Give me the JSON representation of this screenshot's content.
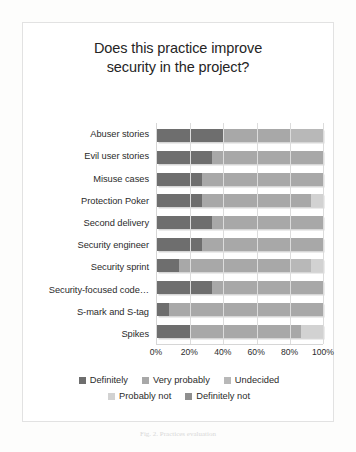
{
  "chart_data": {
    "type": "bar",
    "title": "Does this practice improve security in the project?",
    "title_line1": "Does this practice improve",
    "title_line2": "security in the project?",
    "xlabel": "",
    "ylabel": "",
    "xlim": [
      0,
      100
    ],
    "xticks": [
      "0%",
      "20%",
      "40%",
      "60%",
      "80%",
      "100%"
    ],
    "xtick_values": [
      0,
      20,
      40,
      60,
      80,
      100
    ],
    "grid": true,
    "stacked": true,
    "orientation": "horizontal",
    "legend_position": "bottom",
    "categories": [
      "Abuser stories",
      "Evil user stories",
      "Misuse cases",
      "Protection Poker",
      "Second delivery",
      "Security engineer",
      "Security sprint",
      "Security-focused code…",
      "S-mark and S-tag",
      "Spikes"
    ],
    "series": [
      {
        "name": "Definitely",
        "color": "#6e6e6e",
        "values": [
          40,
          33,
          27,
          27,
          33,
          27,
          13,
          33,
          7,
          20
        ]
      },
      {
        "name": "Very probably",
        "color": "#a8a8a8",
        "values": [
          40,
          67,
          73,
          66,
          67,
          73,
          67,
          67,
          93,
          67
        ]
      },
      {
        "name": "Undecided",
        "color": "#b8b8b8",
        "values": [
          20,
          0,
          0,
          0,
          0,
          0,
          13,
          0,
          0,
          0
        ]
      },
      {
        "name": "Probably not",
        "color": "#d2d2d2",
        "values": [
          0,
          0,
          0,
          7,
          0,
          0,
          7,
          0,
          0,
          13
        ]
      },
      {
        "name": "Definitely not",
        "color": "#8f8f8f",
        "values": [
          0,
          0,
          0,
          0,
          0,
          0,
          0,
          0,
          0,
          0
        ]
      }
    ]
  },
  "caption": "Fig. 2. Practices evaluation"
}
